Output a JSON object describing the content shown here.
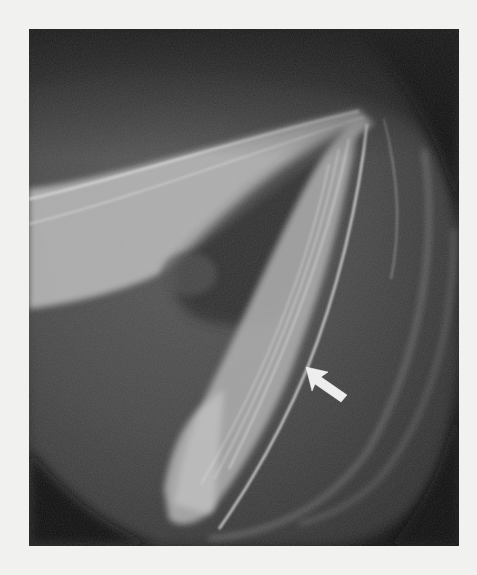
{
  "page": {
    "background": "#f1f1ef"
  },
  "figure": {
    "kind": "grayscale radiograph",
    "frame": {
      "x": 29,
      "y": 29,
      "width": 430,
      "height": 517
    },
    "colors": {
      "dark": "#141414",
      "mid": "#4a4a4a",
      "light": "#c8c8c8",
      "arrow": "#eeeeee"
    },
    "annotations": [
      {
        "type": "arrow",
        "icon": "arrow-up-left-icon",
        "tip": {
          "x": 306,
          "y": 367
        },
        "tail": {
          "x": 344,
          "y": 395
        }
      }
    ]
  }
}
